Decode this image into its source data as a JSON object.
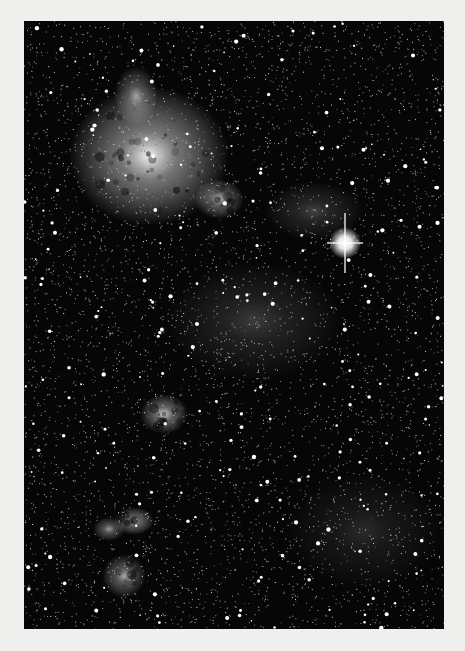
{
  "image": {
    "subject": "star field with bright emission nebulae",
    "background_color": "#efefee",
    "photo_color": "#060606",
    "photo_frame": {
      "left": 24,
      "top": 21,
      "width": 420,
      "height": 608
    }
  },
  "starfield": {
    "seed": 7331,
    "faint_count": 5200,
    "bright_count": 260,
    "star_color": "#ffffff"
  },
  "nebulae": [
    {
      "name": "large-nebula-top-left",
      "cx": 125,
      "cy": 135,
      "rx": 80,
      "ry": 70,
      "intensity": 0.95
    },
    {
      "name": "nebula-knot-1",
      "cx": 195,
      "cy": 178,
      "rx": 25,
      "ry": 20,
      "intensity": 0.7
    },
    {
      "name": "nebula-wisp-top",
      "cx": 112,
      "cy": 75,
      "rx": 22,
      "ry": 30,
      "intensity": 0.6
    },
    {
      "name": "nebula-mid-left",
      "cx": 140,
      "cy": 393,
      "rx": 24,
      "ry": 20,
      "intensity": 0.8
    },
    {
      "name": "nebula-lower-left-1",
      "cx": 110,
      "cy": 500,
      "rx": 20,
      "ry": 14,
      "intensity": 0.75
    },
    {
      "name": "nebula-lower-left-2",
      "cx": 85,
      "cy": 508,
      "rx": 16,
      "ry": 12,
      "intensity": 0.6
    },
    {
      "name": "nebula-bottom-left",
      "cx": 100,
      "cy": 555,
      "rx": 22,
      "ry": 22,
      "intensity": 0.65
    },
    {
      "name": "cluster-center",
      "cx": 230,
      "cy": 300,
      "rx": 90,
      "ry": 60,
      "intensity": 0.22
    },
    {
      "name": "cluster-lower-right",
      "cx": 340,
      "cy": 510,
      "rx": 80,
      "ry": 60,
      "intensity": 0.15
    },
    {
      "name": "glow-right-upper",
      "cx": 290,
      "cy": 190,
      "rx": 50,
      "ry": 30,
      "intensity": 0.25
    }
  ],
  "bright_star": {
    "name": "bright-star-with-diffraction-spikes",
    "cx": 321,
    "cy": 222,
    "size": 10,
    "spike_length": 30
  }
}
